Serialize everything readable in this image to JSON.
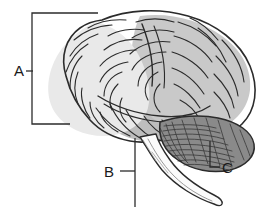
{
  "figure": {
    "background_color": "#ffffff",
    "line_color": "#2b2b2b",
    "label_color": "#1a1a1a",
    "width": 268,
    "height": 218
  },
  "labels": [
    {
      "id": "A",
      "text": "A",
      "target_region": "cerebrum",
      "leader_style": "bracket",
      "x": 14,
      "y": 76
    },
    {
      "id": "B",
      "text": "B",
      "target_region": "brainstem",
      "leader_style": "line-with-tick",
      "x": 104,
      "y": 177
    },
    {
      "id": "C",
      "text": "C",
      "target_region": "cerebellum",
      "leader_style": "elbow",
      "x": 222,
      "y": 173
    }
  ],
  "regions": [
    {
      "name": "cerebrum-frontal",
      "fill": "#e9e9e9",
      "label_ref": "A"
    },
    {
      "name": "cerebrum-parietal",
      "fill": "#c9c9c9",
      "label_ref": "A"
    },
    {
      "name": "cerebrum-temporal",
      "fill": "#bdbdbd",
      "label_ref": "A"
    },
    {
      "name": "cerebellum",
      "fill": "#8a8a8a",
      "label_ref": "C"
    },
    {
      "name": "brainstem",
      "fill": "#fbfbfb",
      "label_ref": "B"
    }
  ]
}
